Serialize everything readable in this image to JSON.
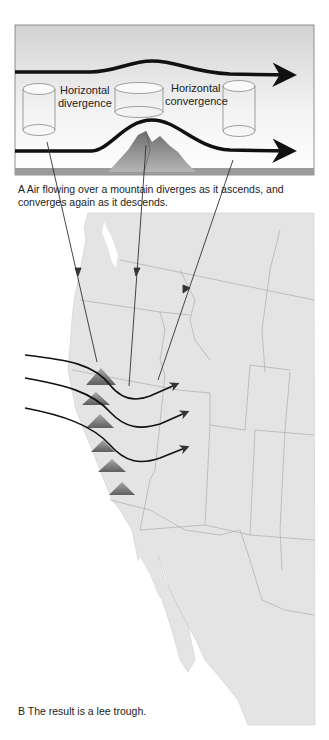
{
  "figure": {
    "panel_a": {
      "labels": {
        "divergence_line1": "Horizontal",
        "divergence_line2": "divergence",
        "convergence_line1": "Horizontal",
        "convergence_line2": "convergence"
      },
      "caption": "A  Air flowing over a mountain diverges as it ascends, and converges again as it descends."
    },
    "panel_b": {
      "caption": "B  The result is a lee trough."
    },
    "colors": {
      "sky_top": "#d4d4d4",
      "sky_bottom": "#fafafa",
      "land": "#e3e3e3",
      "border": "#9a9a9a",
      "flow_line": "#111111",
      "mountain": "#8a8a8a"
    }
  }
}
